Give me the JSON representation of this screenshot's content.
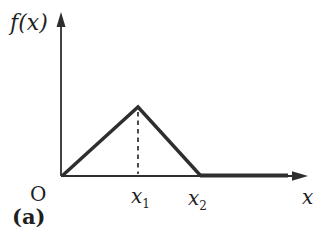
{
  "figure": {
    "background": "#ffffff",
    "line_color": "#2e2e2e",
    "text_color": "#1f1f1f",
    "panel_label": "(a)",
    "y_axis_label": "f(x)",
    "x_axis_label": "x",
    "origin_label": "O",
    "x_ticks": [
      {
        "base": "x",
        "sub": "1"
      },
      {
        "base": "x",
        "sub": "2"
      }
    ],
    "curve": {
      "type": "piecewise-linear",
      "description": "Triangular pulse: f(x) rises linearly from 0 at O to a peak above x1, falls linearly back to 0 at x2, and remains 0 for x greater than x2",
      "points_px": [
        [
          62,
          176
        ],
        [
          138,
          107
        ],
        [
          200,
          175
        ]
      ],
      "zero_segment_px": [
        [
          200,
          175.5
        ],
        [
          288,
          175.5
        ]
      ],
      "peak_dashed_px": [
        [
          138,
          112
        ],
        [
          138,
          174
        ]
      ]
    }
  }
}
